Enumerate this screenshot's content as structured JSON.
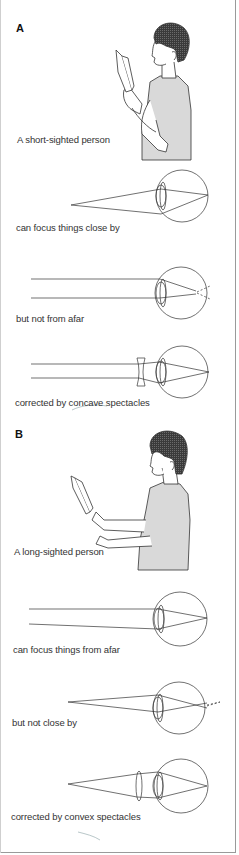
{
  "section_a": {
    "label": "A",
    "person_caption": "A short-sighted person",
    "panels": [
      {
        "caption": "can focus things close by",
        "case": "near-object-focused"
      },
      {
        "caption": "but not from afar",
        "case": "far-object-focus-in-front-of-retina"
      },
      {
        "caption": "corrected by concave spectacles",
        "case": "concave-lens-correction"
      }
    ]
  },
  "section_b": {
    "label": "B",
    "person_caption": "A long-sighted person",
    "panels": [
      {
        "caption": "can focus things from afar",
        "case": "far-object-focused"
      },
      {
        "caption": "but not close by",
        "case": "near-object-focus-behind-retina"
      },
      {
        "caption": "corrected by convex spectacles",
        "case": "convex-lens-correction"
      }
    ]
  },
  "colors": {
    "line": "#333333",
    "shirt": "#d9d9d9",
    "hair": "#4a4a4a",
    "frame": "#9a9a9a"
  }
}
